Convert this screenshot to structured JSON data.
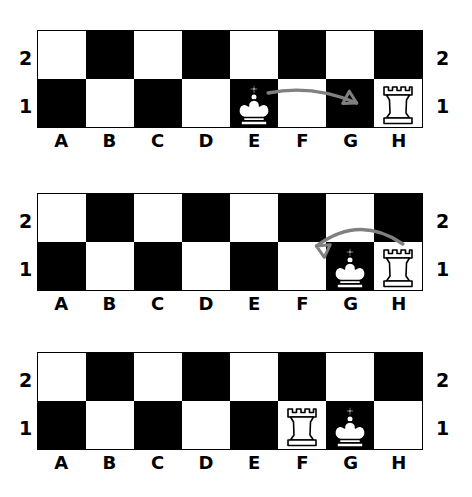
{
  "diagram": {
    "colors": {
      "dark_square": "#000000",
      "light_square": "#ffffff",
      "piece_fill": "#ffffff",
      "piece_stroke": "#000000",
      "arrow": "#808080",
      "label": "#000000"
    },
    "files": [
      "A",
      "B",
      "C",
      "D",
      "E",
      "F",
      "G",
      "H"
    ],
    "ranks": [
      "2",
      "1"
    ],
    "boards": [
      {
        "index": 1,
        "caption": "King moves from E1 to G1",
        "squares": [
          [
            "light",
            "dark",
            "light",
            "dark",
            "light",
            "dark",
            "light",
            "dark"
          ],
          [
            "dark",
            "light",
            "dark",
            "light",
            "dark",
            "light",
            "dark",
            "light"
          ]
        ],
        "pieces": [
          {
            "piece": "king",
            "file": "E",
            "rank": "1",
            "color": "white"
          },
          {
            "piece": "rook",
            "file": "H",
            "rank": "1",
            "color": "white"
          }
        ],
        "arrow": {
          "from_file": "E",
          "from_rank": "1",
          "to_file": "G",
          "to_rank": "1",
          "direction": "right",
          "label": "king-move-arrow"
        }
      },
      {
        "index": 2,
        "caption": "Rook jumps from H1 to F1",
        "squares": [
          [
            "light",
            "dark",
            "light",
            "dark",
            "light",
            "dark",
            "light",
            "dark"
          ],
          [
            "dark",
            "light",
            "dark",
            "light",
            "dark",
            "light",
            "dark",
            "light"
          ]
        ],
        "pieces": [
          {
            "piece": "king",
            "file": "G",
            "rank": "1",
            "color": "white"
          },
          {
            "piece": "rook",
            "file": "H",
            "rank": "1",
            "color": "white"
          }
        ],
        "arrow": {
          "from_file": "H",
          "from_rank": "1",
          "to_file": "F",
          "to_rank": "1",
          "direction": "left",
          "label": "rook-move-arrow"
        }
      },
      {
        "index": 3,
        "caption": "Final castled position",
        "squares": [
          [
            "light",
            "dark",
            "light",
            "dark",
            "light",
            "dark",
            "light",
            "dark"
          ],
          [
            "dark",
            "light",
            "dark",
            "light",
            "dark",
            "light",
            "dark",
            "light"
          ]
        ],
        "pieces": [
          {
            "piece": "rook",
            "file": "F",
            "rank": "1",
            "color": "white"
          },
          {
            "piece": "king",
            "file": "G",
            "rank": "1",
            "color": "white"
          }
        ],
        "arrow": null
      }
    ]
  }
}
